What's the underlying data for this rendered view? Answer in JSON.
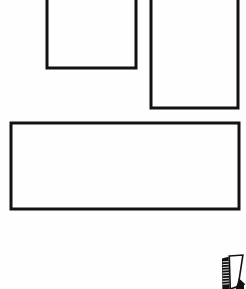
{
  "document": {
    "title": "Line Drawing Fragment",
    "kind": "technical-line-drawing",
    "width": 246,
    "height": 289,
    "background_color": "#fefefe",
    "stroke_color": "#121212"
  },
  "shapes": [
    {
      "name": "rectangle-upper-left",
      "label": "Upper left rectangle",
      "x": 47,
      "y": -14,
      "width": 89,
      "height": 82,
      "stroke_width": 3,
      "clipped_edges": "top"
    },
    {
      "name": "rectangle-upper-right",
      "label": "Upper right rectangle",
      "x": 151,
      "y": -14,
      "width": 87,
      "height": 122,
      "stroke_width": 3,
      "clipped_edges": "top"
    },
    {
      "name": "rectangle-wide-lower",
      "label": "Wide lower rectangle",
      "x": 11,
      "y": 123,
      "width": 228,
      "height": 86,
      "stroke_width": 3,
      "clipped_edges": "none"
    }
  ],
  "icon": {
    "name": "hatched-marker-icon",
    "label": "Hatched marker glyph",
    "x": 222,
    "y": 255,
    "width": 22,
    "height": 34,
    "fill_color": "#111111",
    "clipped_edges": "bottom",
    "rung_count": 9
  },
  "annotations": {
    "caption": ""
  }
}
